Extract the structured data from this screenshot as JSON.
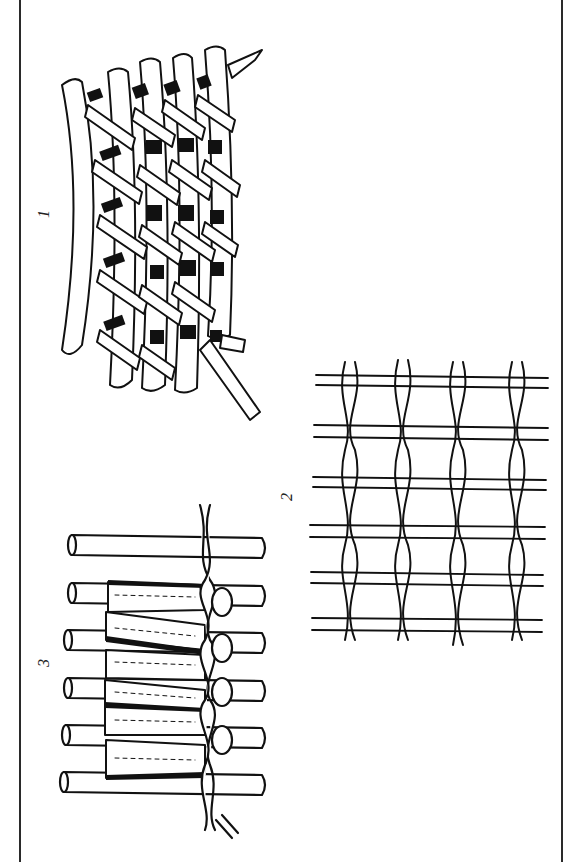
{
  "diagram": {
    "type": "technical-illustration",
    "orientation": "rotated 90 degrees counter-clockwise",
    "colors": {
      "ink": "#111111",
      "paper": "#ffffff",
      "frame": "#2a2a2a"
    },
    "figures": [
      {
        "id": 1,
        "label": "1",
        "description": "Curved frame of stakes interwoven with diagonal flat splints (twill/plain basket weave) with one pointed stake"
      },
      {
        "id": 2,
        "label": "2",
        "description": "Open grid of paired horizontal weft rods twined by paired vertical strands"
      },
      {
        "id": 3,
        "label": "3",
        "description": "Parallel rods bound together with fibrous bundles and a twined cord along one side"
      }
    ]
  }
}
